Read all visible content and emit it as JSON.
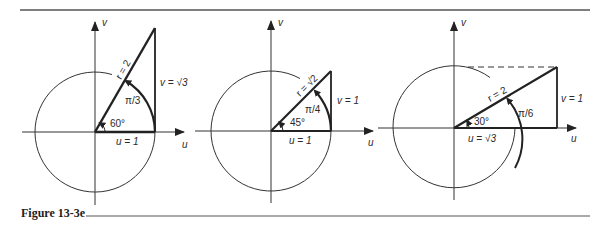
{
  "figure": {
    "caption": "Figure 13-3e",
    "colors": {
      "ink": "#222222",
      "rule": "#555555",
      "background": "#ffffff"
    }
  },
  "panels": [
    {
      "id": "panel-60",
      "axis_u": "u",
      "axis_v": "v",
      "radius_label": "r = 2",
      "angle_deg_label": "60°",
      "angle_rad_label": "π/3",
      "u_label": "u = 1",
      "v_label": "v = √3"
    },
    {
      "id": "panel-45",
      "axis_u": "u",
      "axis_v": "v",
      "radius_label": "r = √2",
      "angle_deg_label": "45°",
      "angle_rad_label": "π/4",
      "u_label": "u = 1",
      "v_label": "v = 1"
    },
    {
      "id": "panel-30",
      "axis_u": "u",
      "axis_v": "v",
      "radius_label": "r = 2",
      "angle_deg_label": "30°",
      "angle_rad_label": "π/6",
      "u_label": "u = √3",
      "v_label": "v = 1"
    }
  ]
}
